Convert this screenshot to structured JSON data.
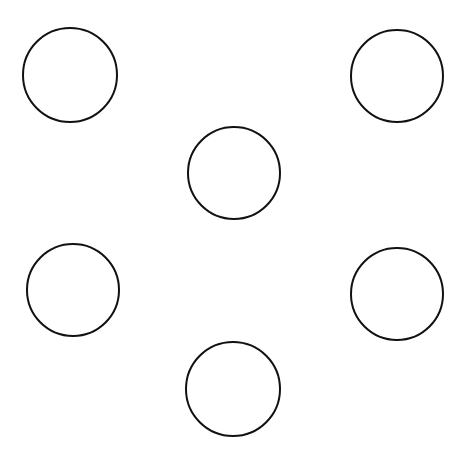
{
  "figure": {
    "width": 466,
    "height": 454,
    "background": "#ffffff",
    "stroke_color": "#111111",
    "stroke_width": 2,
    "circles": [
      {
        "id": "top-left",
        "cx": 70,
        "cy": 75,
        "r": 47
      },
      {
        "id": "top-right",
        "cx": 397,
        "cy": 76,
        "r": 46
      },
      {
        "id": "center",
        "cx": 234,
        "cy": 173,
        "r": 46
      },
      {
        "id": "bottom-left",
        "cx": 73,
        "cy": 290,
        "r": 46
      },
      {
        "id": "bottom-right",
        "cx": 397,
        "cy": 294,
        "r": 46
      },
      {
        "id": "bottom-center",
        "cx": 233,
        "cy": 389,
        "r": 47
      }
    ]
  }
}
